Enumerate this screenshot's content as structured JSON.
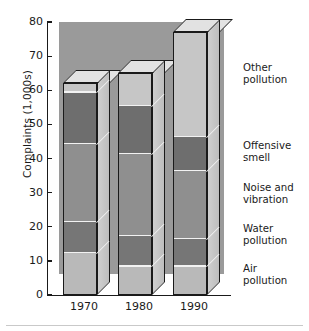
{
  "chart_data": {
    "type": "bar",
    "subtype": "stacked-3d-column",
    "title": "",
    "xlabel": "",
    "ylabel": "Complaints (1,000s)",
    "categories": [
      "1970",
      "1980",
      "1990"
    ],
    "ylim": [
      0,
      80
    ],
    "yticks": [
      0,
      10,
      20,
      30,
      40,
      50,
      60,
      70,
      80
    ],
    "ytick_labels": [
      "0",
      "10",
      "20",
      "30",
      "40",
      "50",
      "60",
      "70",
      "80"
    ],
    "grid": false,
    "legend_position": "right",
    "series": [
      {
        "name": "Air pollution",
        "color": "#b9b9b9",
        "values": [
          12,
          8,
          8
        ]
      },
      {
        "name": "Water pollution",
        "color": "#767676",
        "values": [
          9,
          9,
          8
        ]
      },
      {
        "name": "Noise and vibration",
        "color": "#8f8f8f",
        "values": [
          23,
          24,
          20
        ]
      },
      {
        "name": "Offensive smell",
        "color": "#6e6e6e",
        "values": [
          15,
          14,
          10
        ]
      },
      {
        "name": "Other pollution",
        "color": "#c6c6c6",
        "values": [
          3,
          10,
          31
        ]
      }
    ],
    "totals": [
      62,
      65,
      77
    ],
    "cumulative_boundaries": {
      "1970": [
        0,
        12,
        21,
        44,
        59,
        62
      ],
      "1980": [
        0,
        8,
        17,
        41,
        55,
        65
      ],
      "1990": [
        0,
        8,
        16,
        36,
        46,
        77
      ]
    },
    "annotations": []
  },
  "legend": {
    "entries": [
      {
        "line1": "Other",
        "line2": "pollution"
      },
      {
        "line1": "Offensive",
        "line2": "smell"
      },
      {
        "line1": "Noise and",
        "line2": "vibration"
      },
      {
        "line1": "Water",
        "line2": "pollution"
      },
      {
        "line1": "Air",
        "line2": "pollution"
      }
    ]
  },
  "colors": {
    "panel_background": "#9a9a9a",
    "page_background": "#ffffff",
    "axis": "#1a1a1a",
    "separator": "#f2f2f2",
    "bar_top_face": "#e2e2e2",
    "bar_side_face": "#cfcfcf",
    "text": "#1a1a1a"
  }
}
